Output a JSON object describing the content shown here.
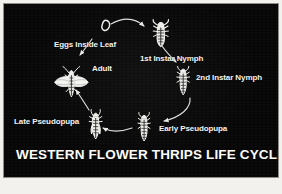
{
  "figure": {
    "title": "WESTERN FLOWER THRIPS LIFE CYCLE",
    "background_color": "#050505",
    "text_color": "#f4f4f2",
    "border_color": "#8e8d8a",
    "page_color": "#f2f1ee"
  },
  "diagram": {
    "type": "life-cycle",
    "orientation": "clockwise",
    "stages": [
      {
        "id": "eggs",
        "label": "Eggs Inside Leaf",
        "icon": "thrips-egg-icon",
        "label_x": 50,
        "label_y": 36,
        "art_x": 97,
        "art_y": 15
      },
      {
        "id": "first-instar",
        "label": "1st Instar Nymph",
        "icon": "first-instar-nymph-icon",
        "label_x": 136,
        "label_y": 50,
        "art_x": 148,
        "art_y": 15
      },
      {
        "id": "second-instar",
        "label": "2nd Instar Nymph",
        "icon": "second-instar-nymph-icon",
        "label_x": 192,
        "label_y": 69,
        "art_x": 172,
        "art_y": 62
      },
      {
        "id": "early-pseudopupa",
        "label": "Early Pseudopupa",
        "icon": "early-pseudopupa-icon",
        "label_x": 155,
        "label_y": 120,
        "art_x": 133,
        "art_y": 108
      },
      {
        "id": "late-pseudopupa",
        "label": "Late Pseudopupa",
        "icon": "late-pseudopupa-icon",
        "label_x": 10,
        "label_y": 113,
        "art_x": 84,
        "art_y": 105
      },
      {
        "id": "adult",
        "label": "Adult",
        "icon": "adult-thrips-icon",
        "label_x": 88,
        "label_y": 60,
        "art_x": 50,
        "art_y": 62
      }
    ],
    "arrows": [
      {
        "id": "eggs-to-first-instar",
        "from": "eggs",
        "to": "first-instar"
      },
      {
        "id": "first-instar-to-second-instar",
        "from": "first-instar",
        "to": "second-instar"
      },
      {
        "id": "second-instar-to-early-pseudopupa",
        "from": "second-instar",
        "to": "early-pseudopupa"
      },
      {
        "id": "early-to-late-pseudopupa",
        "from": "early-pseudopupa",
        "to": "late-pseudopupa"
      },
      {
        "id": "late-pseudopupa-to-adult",
        "from": "late-pseudopupa",
        "to": "adult"
      },
      {
        "id": "adult-to-eggs",
        "from": "adult",
        "to": "eggs"
      }
    ]
  }
}
